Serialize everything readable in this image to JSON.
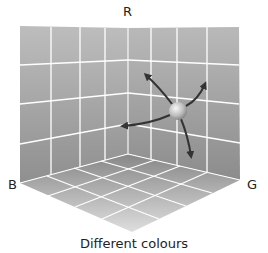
{
  "diagram": {
    "axes": {
      "r_label": "R",
      "b_label": "B",
      "g_label": "G"
    },
    "caption": "Different colours",
    "grid_divisions": 4,
    "colors": {
      "wall_top": "#b8b8b8",
      "wall_bottom": "#8e8e8e",
      "floor_back": "#8a8a8a",
      "floor_front": "#d8d8d8",
      "grid_line": "#ffffff",
      "arrow": "#3a3a3a",
      "sphere_light": "#f4f4f4",
      "sphere_dark": "#8a8a8a"
    },
    "sphere": {
      "cx": 178,
      "cy": 111,
      "r": 9
    },
    "arrows_count": 4
  }
}
